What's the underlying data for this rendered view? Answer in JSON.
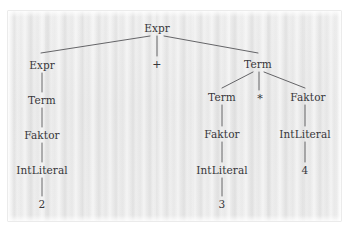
{
  "figure": {
    "kind": "parse-tree",
    "expression": "2 + 3 * 4",
    "background_color": "#e9e9e9",
    "page_color": "#ffffff",
    "edge_color": "#555558",
    "text_color": "#37373a"
  },
  "nodes": [
    {
      "id": "root",
      "label": "Expr",
      "x": 157,
      "y": 28,
      "role": "nonterminal"
    },
    {
      "id": "left-expr",
      "label": "Expr",
      "x": 42,
      "y": 65,
      "role": "nonterminal"
    },
    {
      "id": "plus",
      "label": "+",
      "x": 157,
      "y": 64,
      "role": "operator"
    },
    {
      "id": "right-term",
      "label": "Term",
      "x": 258,
      "y": 64,
      "role": "nonterminal"
    },
    {
      "id": "left-term",
      "label": "Term",
      "x": 42,
      "y": 100,
      "role": "nonterminal"
    },
    {
      "id": "left-faktor",
      "label": "Faktor",
      "x": 42,
      "y": 135,
      "role": "nonterminal"
    },
    {
      "id": "left-int",
      "label": "IntLiteral",
      "x": 42,
      "y": 170,
      "role": "terminal"
    },
    {
      "id": "left-value",
      "label": "2",
      "x": 42,
      "y": 204,
      "role": "value"
    },
    {
      "id": "mid-term",
      "label": "Term",
      "x": 222,
      "y": 97,
      "role": "nonterminal"
    },
    {
      "id": "star",
      "label": "*",
      "x": 260,
      "y": 98,
      "role": "operator"
    },
    {
      "id": "right-faktor",
      "label": "Faktor",
      "x": 308,
      "y": 97,
      "role": "nonterminal"
    },
    {
      "id": "mid-faktor",
      "label": "Faktor",
      "x": 222,
      "y": 134,
      "role": "nonterminal"
    },
    {
      "id": "mid-int",
      "label": "IntLiteral",
      "x": 222,
      "y": 170,
      "role": "terminal"
    },
    {
      "id": "mid-value",
      "label": "3",
      "x": 222,
      "y": 204,
      "role": "value"
    },
    {
      "id": "right-int",
      "label": "IntLiteral",
      "x": 305,
      "y": 134,
      "role": "terminal"
    },
    {
      "id": "right-value",
      "label": "4",
      "x": 305,
      "y": 170,
      "role": "value"
    }
  ],
  "edges": [
    {
      "from": "root",
      "to": "left-expr",
      "x1": 150,
      "y1": 36,
      "x2": 41,
      "y2": 53
    },
    {
      "from": "root",
      "to": "plus",
      "x1": 157,
      "y1": 36,
      "x2": 157,
      "y2": 56
    },
    {
      "from": "root",
      "to": "right-term",
      "x1": 164,
      "y1": 36,
      "x2": 258,
      "y2": 53
    },
    {
      "from": "left-expr",
      "to": "left-term",
      "x1": 42,
      "y1": 73,
      "x2": 42,
      "y2": 92
    },
    {
      "from": "left-term",
      "to": "left-faktor",
      "x1": 42,
      "y1": 108,
      "x2": 42,
      "y2": 127
    },
    {
      "from": "left-faktor",
      "to": "left-int",
      "x1": 42,
      "y1": 143,
      "x2": 42,
      "y2": 162
    },
    {
      "from": "left-int",
      "to": "left-value",
      "x1": 42,
      "y1": 178,
      "x2": 42,
      "y2": 196
    },
    {
      "from": "right-term",
      "to": "mid-term",
      "x1": 253,
      "y1": 72,
      "x2": 222,
      "y2": 88
    },
    {
      "from": "right-term",
      "to": "star",
      "x1": 259,
      "y1": 72,
      "x2": 259,
      "y2": 90
    },
    {
      "from": "right-term",
      "to": "right-faktor",
      "x1": 264,
      "y1": 72,
      "x2": 305,
      "y2": 88
    },
    {
      "from": "mid-term",
      "to": "mid-faktor",
      "x1": 222,
      "y1": 105,
      "x2": 222,
      "y2": 126
    },
    {
      "from": "mid-faktor",
      "to": "mid-int",
      "x1": 222,
      "y1": 142,
      "x2": 222,
      "y2": 162
    },
    {
      "from": "mid-int",
      "to": "mid-value",
      "x1": 222,
      "y1": 178,
      "x2": 222,
      "y2": 196
    },
    {
      "from": "right-faktor",
      "to": "right-int",
      "x1": 305,
      "y1": 105,
      "x2": 305,
      "y2": 126
    },
    {
      "from": "right-int",
      "to": "right-value",
      "x1": 305,
      "y1": 142,
      "x2": 305,
      "y2": 162
    }
  ]
}
